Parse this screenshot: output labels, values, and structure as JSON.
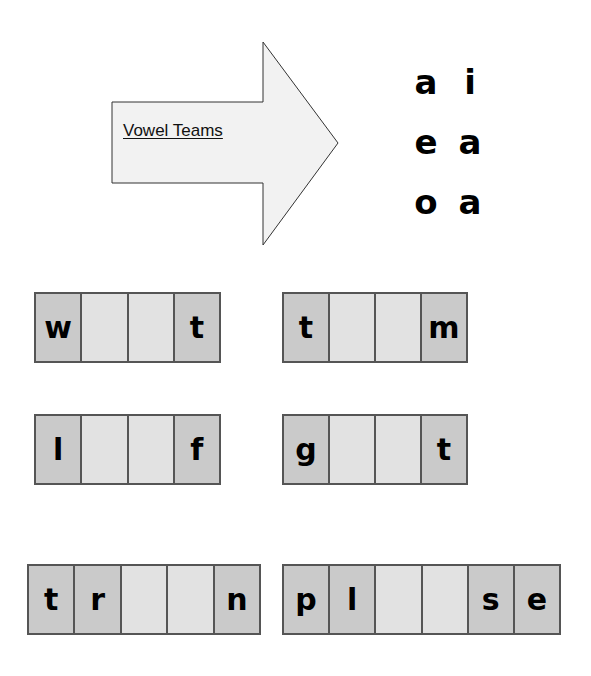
{
  "arrow": {
    "label": "Vowel Teams",
    "fill": "#f2f2f2",
    "stroke": "#333333"
  },
  "vowel_teams": [
    [
      "a",
      "i"
    ],
    [
      "e",
      "a"
    ],
    [
      "o",
      "a"
    ]
  ],
  "colors": {
    "filled_cell": "#cacaca",
    "blank_cell": "#e2e2e2",
    "border": "#555555"
  },
  "words": [
    {
      "cells": [
        "w",
        "",
        "",
        "t"
      ]
    },
    {
      "cells": [
        "t",
        "",
        "",
        "m"
      ]
    },
    {
      "cells": [
        "l",
        "",
        "",
        "f"
      ]
    },
    {
      "cells": [
        "g",
        "",
        "",
        "t"
      ]
    },
    {
      "cells": [
        "t",
        "r",
        "",
        "",
        "n"
      ]
    },
    {
      "cells": [
        "p",
        "l",
        "",
        "",
        "s",
        "e"
      ]
    }
  ]
}
